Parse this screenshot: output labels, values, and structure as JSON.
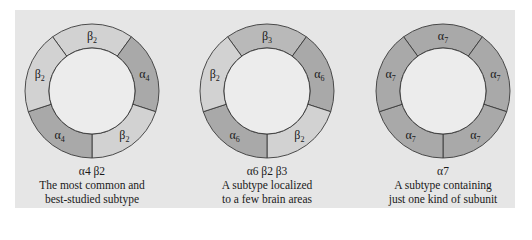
{
  "figure": {
    "colors": {
      "background": "#e6e6e6",
      "inner": "#ececec",
      "alpha": "#a9a9a9",
      "beta_light": "#d2d2d2",
      "beta3": "#b9b9b9",
      "stroke": "#3a3a3a"
    },
    "receptors": [
      {
        "name": "α4 β2",
        "description_line1": "The most common and",
        "description_line2": "best-studied subtype",
        "subunits": [
          {
            "position": "top",
            "label": "β",
            "sub": "2",
            "shade": "beta_light"
          },
          {
            "position": "right",
            "label": "α",
            "sub": "4",
            "shade": "alpha"
          },
          {
            "position": "bottom-right",
            "label": "β",
            "sub": "2",
            "shade": "beta_light"
          },
          {
            "position": "bottom-left",
            "label": "α",
            "sub": "4",
            "shade": "alpha"
          },
          {
            "position": "left",
            "label": "β",
            "sub": "2",
            "shade": "beta_light"
          }
        ]
      },
      {
        "name": "α6 β2 β3",
        "description_line1": "A subtype localized",
        "description_line2": "to a few brain areas",
        "subunits": [
          {
            "position": "top",
            "label": "β",
            "sub": "3",
            "shade": "beta3"
          },
          {
            "position": "right",
            "label": "α",
            "sub": "6",
            "shade": "alpha"
          },
          {
            "position": "bottom-right",
            "label": "β",
            "sub": "2",
            "shade": "beta_light"
          },
          {
            "position": "bottom-left",
            "label": "α",
            "sub": "6",
            "shade": "alpha"
          },
          {
            "position": "left",
            "label": "β",
            "sub": "2",
            "shade": "beta_light"
          }
        ]
      },
      {
        "name": "α7",
        "description_line1": "A subtype containing",
        "description_line2": "just one kind of subunit",
        "subunits": [
          {
            "position": "top",
            "label": "α",
            "sub": "7",
            "shade": "alpha"
          },
          {
            "position": "right",
            "label": "α",
            "sub": "7",
            "shade": "alpha"
          },
          {
            "position": "bottom-right",
            "label": "α",
            "sub": "7",
            "shade": "alpha"
          },
          {
            "position": "bottom-left",
            "label": "α",
            "sub": "7",
            "shade": "alpha"
          },
          {
            "position": "left",
            "label": "α",
            "sub": "7",
            "shade": "alpha"
          }
        ]
      }
    ]
  }
}
